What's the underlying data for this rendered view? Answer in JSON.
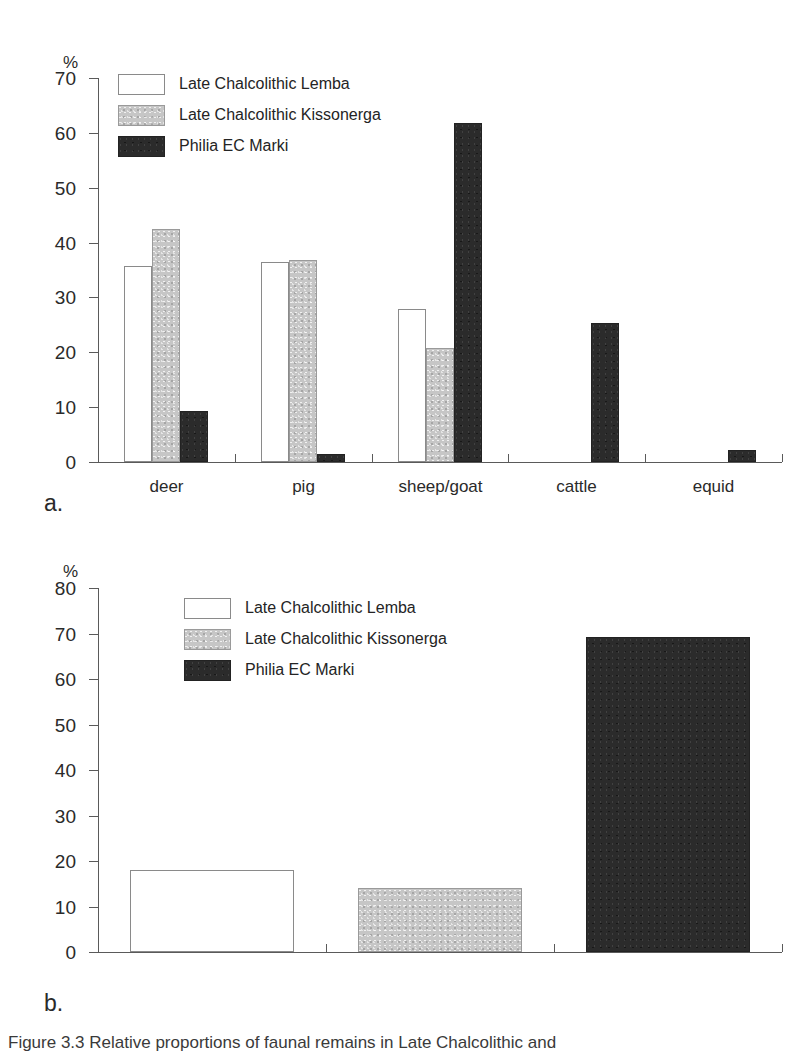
{
  "page": {
    "background_color": "#ffffff",
    "width": 812,
    "height": 1053
  },
  "series_colors": {
    "late_chalcolithic_lemba": "#ffffff",
    "late_chalcolithic_kissonerga": "#c6c6c6",
    "philia_ec_marki": "#2b2b2b",
    "axis": "#5a5a5a",
    "text": "#2a2a2a"
  },
  "panel_a": {
    "letter": "a.",
    "axis_unit": "%",
    "legend": [
      {
        "label": "Late Chalcolithic Lemba",
        "swatch": "open-white-swatch"
      },
      {
        "label": "Late Chalcolithic Kissonerga",
        "swatch": "light-grey-swatch"
      },
      {
        "label": "Philia EC Marki",
        "swatch": "dark-charcoal-swatch"
      }
    ],
    "y_ticks": [
      "70",
      "60",
      "50",
      "40",
      "30",
      "20",
      "10",
      "0"
    ],
    "x_labels": [
      "deer",
      "pig",
      "sheep/goat",
      "cattle",
      "equid"
    ]
  },
  "panel_b": {
    "letter": "b.",
    "axis_unit": "%",
    "legend": [
      {
        "label": "Late Chalcolithic Lemba",
        "swatch": "open-white-swatch"
      },
      {
        "label": "Late Chalcolithic Kissonerga",
        "swatch": "light-grey-swatch"
      },
      {
        "label": "Philia EC Marki",
        "swatch": "dark-charcoal-swatch"
      }
    ],
    "y_ticks": [
      "80",
      "70",
      "60",
      "50",
      "40",
      "30",
      "20",
      "10",
      "0"
    ],
    "x_labels": [
      "",
      "",
      ""
    ]
  },
  "caption": {
    "text": "Figure 3.3   Relative proportions of faunal remains in Late Chalcolithic and"
  },
  "chart_data": [
    {
      "id": "panel-a",
      "type": "bar",
      "title": "",
      "xlabel": "",
      "ylabel": "%",
      "ylim": [
        0,
        70
      ],
      "ytick_step": 10,
      "grid": false,
      "legend_position": "top-left-inside",
      "categories": [
        "deer",
        "pig",
        "sheep/goat",
        "cattle",
        "equid"
      ],
      "series": [
        {
          "name": "Late Chalcolithic Lemba",
          "color": "#ffffff",
          "values": [
            35.8,
            36.4,
            27.8,
            0,
            0
          ]
        },
        {
          "name": "Late Chalcolithic Kissonerga",
          "color": "#c6c6c6",
          "values": [
            42.5,
            36.9,
            20.7,
            0,
            0
          ]
        },
        {
          "name": "Philia EC Marki",
          "color": "#2b2b2b",
          "values": [
            9.3,
            1.5,
            61.8,
            25.4,
            2.2
          ]
        }
      ]
    },
    {
      "id": "panel-b",
      "type": "bar",
      "title": "",
      "xlabel": "",
      "ylabel": "%",
      "ylim": [
        0,
        80
      ],
      "ytick_step": 10,
      "grid": false,
      "legend_position": "top-left-inside",
      "categories": [
        "Late Chalcolithic Lemba",
        "Late Chalcolithic Kissonerga",
        "Philia EC Marki"
      ],
      "values": [
        18.0,
        14.1,
        69.2
      ],
      "colors": [
        "#ffffff",
        "#c6c6c6",
        "#2b2b2b"
      ]
    }
  ]
}
